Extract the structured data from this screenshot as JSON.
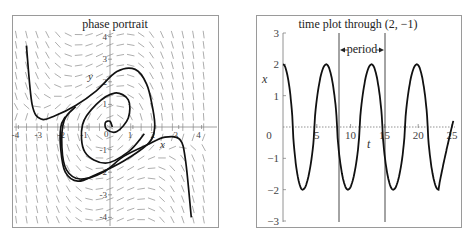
{
  "chart_data": [
    {
      "type": "line",
      "subtype": "phase-portrait-direction-field",
      "title": "phase portrait",
      "xlabel": "x",
      "ylabel": "y",
      "xlim": [
        -4.4,
        4.4
      ],
      "ylim": [
        -4.4,
        4.4
      ],
      "x_ticks": [
        "-4",
        "-3",
        "-2",
        "-1",
        "0",
        "1",
        "2",
        "3",
        "4"
      ],
      "y_ticks": [
        "4",
        "3",
        "2",
        "1",
        "-1",
        "-2",
        "-3",
        "-4"
      ],
      "grid": false,
      "direction_field": true,
      "series": [
        {
          "name": "trajectory-outer-left",
          "points": [
            [
              -3.65,
              3.6
            ],
            [
              -3.4,
              1.0
            ],
            [
              -3.0,
              0.35
            ],
            [
              -2.4,
              0.5
            ],
            [
              -1.5,
              0.95
            ],
            [
              -0.6,
              1.6
            ],
            [
              0.3,
              2.45
            ],
            [
              1.1,
              2.55
            ],
            [
              1.6,
              1.9
            ],
            [
              1.85,
              0.9
            ],
            [
              1.95,
              0.0
            ],
            [
              1.7,
              -0.7
            ],
            [
              0.6,
              -1.5
            ],
            [
              -0.6,
              -2.1
            ],
            [
              -1.4,
              -2.4
            ],
            [
              -1.95,
              -2.0
            ],
            [
              -2.15,
              -1.0
            ],
            [
              -2.15,
              0.0
            ],
            [
              -1.95,
              0.45
            ]
          ]
        },
        {
          "name": "trajectory-outer-right",
          "points": [
            [
              3.55,
              -4.0
            ],
            [
              3.3,
              -1.5
            ],
            [
              3.05,
              -0.55
            ],
            [
              2.4,
              -0.45
            ],
            [
              1.6,
              -0.8
            ],
            [
              0.6,
              -1.3
            ],
            [
              -0.3,
              -2.0
            ],
            [
              -1.3,
              -2.3
            ],
            [
              -1.9,
              -1.9
            ],
            [
              -2.1,
              -0.9
            ],
            [
              -2.0,
              0.3
            ],
            [
              -1.5,
              0.9
            ]
          ]
        },
        {
          "name": "trajectory-spiral",
          "points": [
            [
              0.1,
              0.0
            ],
            [
              0.0,
              0.25
            ],
            [
              -0.2,
              0.2
            ],
            [
              -0.15,
              -0.1
            ],
            [
              0.3,
              -0.2
            ],
            [
              0.8,
              0.4
            ],
            [
              0.8,
              1.2
            ],
            [
              0.2,
              1.5
            ],
            [
              -0.6,
              1.0
            ],
            [
              -1.2,
              0.1
            ],
            [
              -1.1,
              -1.1
            ],
            [
              -0.2,
              -1.6
            ],
            [
              0.8,
              -1.1
            ],
            [
              1.5,
              -0.3
            ]
          ]
        }
      ]
    },
    {
      "type": "line",
      "title": "time plot through (2, −1)",
      "xlabel": "t",
      "ylabel": "x",
      "xlim": [
        0,
        25
      ],
      "ylim": [
        -3,
        3
      ],
      "x_ticks": [
        "0",
        "5",
        "10",
        "15",
        "20",
        "25"
      ],
      "y_ticks": [
        "3",
        "2",
        "1",
        "0",
        "−1",
        "−2",
        "−3"
      ],
      "grid": false,
      "initial_point": [
        2,
        -1
      ],
      "amplitude": 2,
      "period_approx": 6.7,
      "annotations": [
        {
          "text": "period",
          "from_t": 8.3,
          "to_t": 15.0,
          "vertical_lines_at_t": [
            8.3,
            15.0
          ]
        }
      ],
      "series": [
        {
          "name": "x(t)",
          "peaks_t": [
            0,
            6.4,
            13.1,
            19.8
          ],
          "troughs_t": [
            2.9,
            9.6,
            16.3,
            23.0
          ],
          "peak_value": 2,
          "trough_value": -2
        }
      ]
    }
  ],
  "left": {
    "title": "phase portrait",
    "x_label": "x",
    "y_label": "y",
    "x_ticks": [
      "-4",
      "-3",
      "-2",
      "-1",
      "0",
      "1",
      "2",
      "3",
      "4"
    ],
    "y_ticks_pos": [
      "4",
      "3",
      "2",
      "1"
    ],
    "y_ticks_neg": [
      "-1",
      "-2",
      "-3",
      "-4"
    ]
  },
  "right": {
    "title": "time plot through (2, −1)",
    "x_label": "t",
    "y_label": "x",
    "x_ticks": [
      "0",
      "5",
      "10",
      "15",
      "20",
      "25"
    ],
    "y_ticks": [
      "3",
      "2",
      "1",
      "−1",
      "−2",
      "−3"
    ],
    "period_label": "period"
  }
}
